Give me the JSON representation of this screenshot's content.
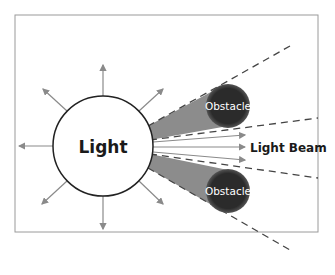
{
  "diagram": {
    "light_label": "Light",
    "beam_label": "Light Beam",
    "obstacles": [
      {
        "label": "Obstacle"
      },
      {
        "label": "Obstacle"
      }
    ],
    "colors": {
      "frame": "#9a9a9a",
      "ray": "#8a8a8a",
      "shadow": "#8c8c8c",
      "obstacle": "#2b2b2b",
      "dash": "#444444",
      "text": "#1a1a1a"
    }
  }
}
